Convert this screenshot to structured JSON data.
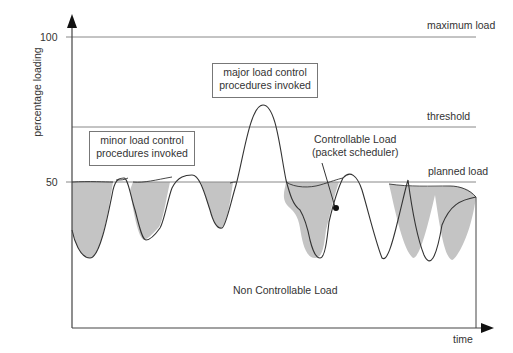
{
  "diagram": {
    "y_axis_label": "percentage loading",
    "x_axis_label": "time",
    "ticks": [
      {
        "label": "100",
        "y": 37
      },
      {
        "label": "50",
        "y": 182
      }
    ],
    "lines": {
      "maximum": "maximum load",
      "threshold": "threshold",
      "planned": "planned load"
    },
    "boxes": {
      "minor": [
        "minor load control",
        "procedures invoked"
      ],
      "major": [
        "major load control",
        "procedures invoked"
      ]
    },
    "annotations": {
      "controllable": [
        "Controllable Load",
        "(packet scheduler)"
      ],
      "non_controllable": "Non Controllable Load"
    },
    "colors": {
      "fill": "#c4c4c4",
      "line": "#333333",
      "grid": "#888888"
    }
  }
}
